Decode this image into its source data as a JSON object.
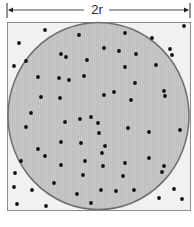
{
  "diagram": {
    "dimension_label": "2r",
    "caption_partial": "",
    "colors": {
      "background": "#ffffff",
      "square_fill": "#f1f1f1",
      "square_border": "#8c8c8c",
      "circle_fill": "#c6c6c6",
      "circle_stroke": "#6e6e6e",
      "dot": "#111111",
      "arrow": "#4a4a4a"
    },
    "square": {
      "x": 7,
      "y": 22,
      "width": 184,
      "height": 189
    },
    "circle": {
      "cx": 98.5,
      "cy": 116,
      "rx": 91,
      "ry": 94
    },
    "arrow": {
      "y": 10,
      "x1": 8,
      "x2": 189,
      "tick_top": 3,
      "tick_bottom": 18,
      "gap_start": 84,
      "gap_end": 109
    },
    "points": [
      [
        45,
        30
      ],
      [
        79,
        35
      ],
      [
        19,
        43
      ],
      [
        61,
        54
      ],
      [
        66,
        57
      ],
      [
        87,
        60
      ],
      [
        26,
        61
      ],
      [
        14,
        66
      ],
      [
        38,
        77
      ],
      [
        59,
        78
      ],
      [
        69,
        80
      ],
      [
        84,
        76
      ],
      [
        41,
        97
      ],
      [
        60,
        98
      ],
      [
        31,
        113
      ],
      [
        184,
        26
      ],
      [
        125,
        33
      ],
      [
        152,
        38
      ],
      [
        104,
        48
      ],
      [
        119,
        51
      ],
      [
        136,
        54
      ],
      [
        170,
        49
      ],
      [
        172,
        55
      ],
      [
        125,
        67
      ],
      [
        156,
        65
      ],
      [
        135,
        83
      ],
      [
        104,
        95
      ],
      [
        114,
        92
      ],
      [
        131,
        100
      ],
      [
        164,
        91
      ],
      [
        165,
        96
      ],
      [
        26,
        127
      ],
      [
        65,
        122
      ],
      [
        80,
        119
      ],
      [
        91,
        117
      ],
      [
        61,
        142
      ],
      [
        81,
        143
      ],
      [
        38,
        149
      ],
      [
        45,
        156
      ],
      [
        21,
        161
      ],
      [
        61,
        165
      ],
      [
        85,
        161
      ],
      [
        15,
        173
      ],
      [
        83,
        175
      ],
      [
        54,
        183
      ],
      [
        14,
        187
      ],
      [
        32,
        190
      ],
      [
        77,
        194
      ],
      [
        17,
        204
      ],
      [
        46,
        206
      ],
      [
        91,
        203
      ],
      [
        98,
        123
      ],
      [
        99,
        133
      ],
      [
        128,
        128
      ],
      [
        149,
        132
      ],
      [
        180,
        130
      ],
      [
        105,
        146
      ],
      [
        102,
        153
      ],
      [
        149,
        158
      ],
      [
        125,
        163
      ],
      [
        103,
        166
      ],
      [
        164,
        166
      ],
      [
        162,
        172
      ],
      [
        123,
        176
      ],
      [
        101,
        190
      ],
      [
        116,
        191
      ],
      [
        134,
        190
      ],
      [
        174,
        189
      ],
      [
        159,
        198
      ],
      [
        182,
        199
      ]
    ]
  }
}
